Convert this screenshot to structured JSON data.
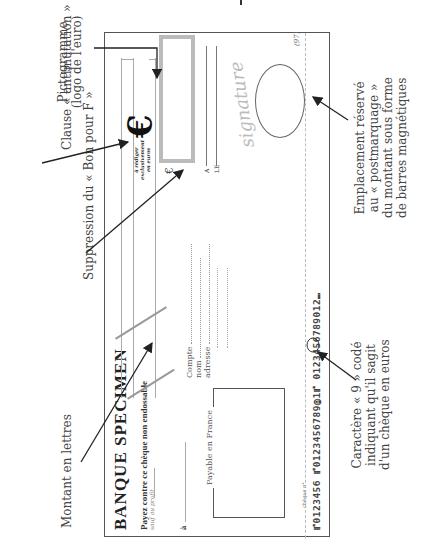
{
  "check": {
    "bank_name": "BANQUE  SPECIMEN",
    "payez": "Payez contre ce chèque non endossable",
    "ordre": "sauf au profit",
    "a_label": "à",
    "payable": "Payable en France",
    "cheque_no": "chèque n°",
    "compte": "Compte",
    "nom": "nom",
    "adresse": "adresse",
    "magnetic_line": "⑈0123456  ⑈0123456789⓪1⑈ 0123456789012⑉",
    "code": "(97)",
    "euro_small": "€",
    "euro_logo": "€",
    "rediger": [
      "à rédiger",
      "exclusivement",
      "en euros"
    ],
    "a_place": "A",
    "le_place": "LE",
    "signature": "signature"
  },
  "annotations": {
    "pictogramme": [
      "Pictogramme",
      "(logo de l'euro)"
    ],
    "clause": "Clause « antimutation »",
    "suppression": "Suppression du « Bon pour F »",
    "montant": "Montant en lettres",
    "emplacement": [
      "Emplacement réservé",
      "au « postmarquage »",
      "du montant sous forme",
      "de barres magnétiques"
    ],
    "caractere": [
      "Caractère « 9 » codé",
      "indiquant qu'il sagit",
      "d'un chèque en euros"
    ]
  }
}
